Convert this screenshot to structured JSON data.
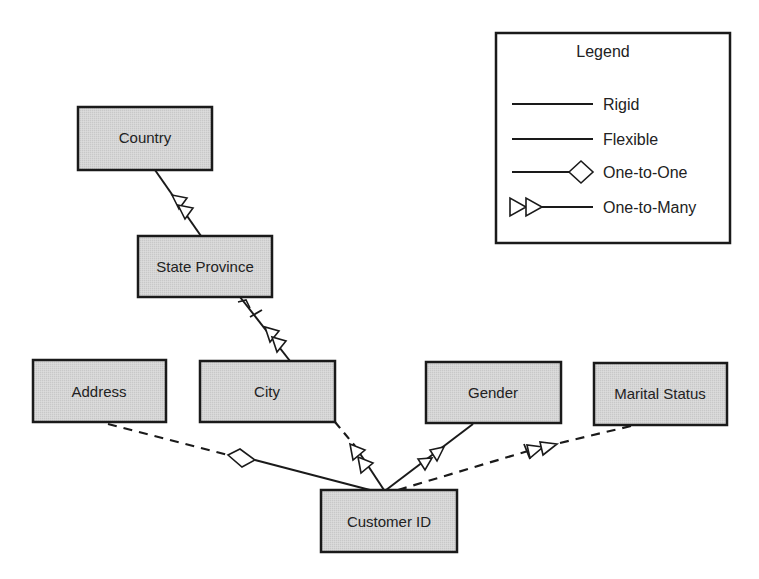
{
  "colors": {
    "entity_fill": "#d3d3d3",
    "stroke": "#1a1a1a",
    "background": "#ffffff"
  },
  "entities": [
    {
      "id": "country",
      "label": "Country"
    },
    {
      "id": "state_province",
      "label": "State Province"
    },
    {
      "id": "address",
      "label": "Address"
    },
    {
      "id": "city",
      "label": "City"
    },
    {
      "id": "gender",
      "label": "Gender"
    },
    {
      "id": "marital_status",
      "label": "Marital Status"
    },
    {
      "id": "customer_id",
      "label": "Customer ID"
    }
  ],
  "relationships": [
    {
      "from": "state_province",
      "to": "country",
      "line": "rigid",
      "cardinality": "one-to-many"
    },
    {
      "from": "city",
      "to": "state_province",
      "line": "rigid",
      "cardinality": "one-to-many",
      "crossed": true
    },
    {
      "from": "customer_id",
      "to": "address",
      "line": "flexible",
      "cardinality": "one-to-one"
    },
    {
      "from": "customer_id",
      "to": "city",
      "line": "flexible",
      "cardinality": "one-to-many"
    },
    {
      "from": "customer_id",
      "to": "gender",
      "line": "rigid",
      "cardinality": "one-to-many"
    },
    {
      "from": "customer_id",
      "to": "marital_status",
      "line": "flexible",
      "cardinality": "one-to-many",
      "crossed": true
    }
  ],
  "legend": {
    "title": "Legend",
    "items": [
      {
        "label": "Rigid",
        "symbol": "line"
      },
      {
        "label": "Flexible",
        "symbol": "line"
      },
      {
        "label": "One-to-One",
        "symbol": "diamond"
      },
      {
        "label": "One-to-Many",
        "symbol": "double-arrow"
      }
    ]
  }
}
